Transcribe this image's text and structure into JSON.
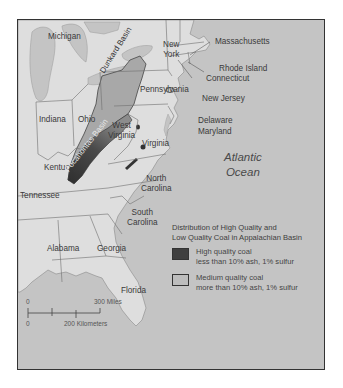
{
  "map": {
    "states": [
      {
        "name": "Michigan",
        "x": 30,
        "y": 12
      },
      {
        "name": "Indiana",
        "x": 21,
        "y": 95
      },
      {
        "name": "Ohio",
        "x": 60,
        "y": 95
      },
      {
        "name": "Kentucky",
        "x": 26,
        "y": 143
      },
      {
        "name": "Tennessee",
        "x": 2,
        "y": 171
      },
      {
        "name": "Pennsylvania",
        "x": 122,
        "y": 65
      },
      {
        "name": "Virginia",
        "x": 124,
        "y": 119
      },
      {
        "name": "New Jersey",
        "x": 184,
        "y": 74
      },
      {
        "name": "Delaware",
        "x": 180,
        "y": 96
      },
      {
        "name": "Maryland",
        "x": 180,
        "y": 107
      },
      {
        "name": "Massachusetts",
        "x": 197,
        "y": 17
      },
      {
        "name": "Rhode Island",
        "x": 201,
        "y": 44
      },
      {
        "name": "Connecticut",
        "x": 188,
        "y": 54
      },
      {
        "name": "Alabama",
        "x": 29,
        "y": 224
      },
      {
        "name": "Georgia",
        "x": 79,
        "y": 224
      },
      {
        "name": "Florida",
        "x": 103,
        "y": 266
      }
    ],
    "multiline_states": [
      {
        "name": "New\nYork",
        "line1": "New",
        "line2": "York",
        "x": 145,
        "y": 20
      },
      {
        "name": "West\nVirginia",
        "line1": "West",
        "line2": "Virginia",
        "x": 90,
        "y": 101
      },
      {
        "name": "North\nCarolina",
        "line1": "North",
        "line2": "Carolina",
        "x": 123,
        "y": 154
      },
      {
        "name": "South\nCarolina",
        "line1": "South",
        "line2": "Carolina",
        "x": 109,
        "y": 188
      }
    ],
    "basins": [
      {
        "name": "Dunkard Basin",
        "x": 94,
        "y": 70,
        "rotate": -58
      },
      {
        "name": "Pocahontas Basin",
        "x": 48,
        "y": 132,
        "rotate": -52
      }
    ],
    "ocean": {
      "line1": "Atlantic",
      "line2": "Ocean"
    },
    "colors": {
      "water": "#c4c4c4",
      "land": "#dedede",
      "high_quality": "#3f3f3f",
      "medium_quality": "#a8a8a8",
      "border": "#6e6e6e"
    }
  },
  "legend": {
    "title_line1": "Distribution of High Quality and",
    "title_line2": "Low Quality Coal in Appalachian Basin",
    "items": [
      {
        "label": "High quality coal",
        "detail": "less than 10% ash, 1% sulfur",
        "color": "#3f3f3f"
      },
      {
        "label": "Medium quality coal",
        "detail": "more than 10% ash, 1% sulfur",
        "color": "#bdbdbd"
      }
    ]
  },
  "scale": {
    "miles_zero": "0",
    "miles_label": "300 Miles",
    "km_zero": "0",
    "km_label": "200 Kilometers"
  }
}
